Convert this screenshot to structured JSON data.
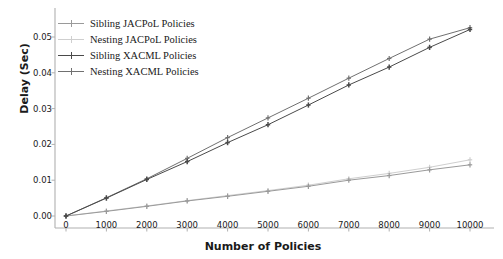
{
  "chart_data": {
    "type": "line",
    "title": "",
    "xlabel": "Number of Policies",
    "ylabel": "Delay (Sec)",
    "x": [
      0,
      1000,
      2000,
      3000,
      4000,
      5000,
      6000,
      7000,
      8000,
      9000,
      10000
    ],
    "xlim": [
      -500,
      10500
    ],
    "ylim": [
      -0.002,
      0.056
    ],
    "xticks": [
      0,
      1000,
      2000,
      3000,
      4000,
      5000,
      6000,
      7000,
      8000,
      9000,
      10000
    ],
    "xticklabels": [
      "0",
      "1000",
      "2000",
      "3000",
      "4000",
      "5000",
      "6000",
      "7000",
      "8000",
      "9000",
      "10000"
    ],
    "yticks": [
      0.0,
      0.01,
      0.02,
      0.03,
      0.04,
      0.05
    ],
    "yticklabels": [
      "0.00",
      "0.01",
      "0.02",
      "0.03",
      "0.04",
      "0.05"
    ],
    "grid": false,
    "legend_position": "upper left",
    "series": [
      {
        "name": "Sibling JACPoL Policies",
        "color": "#9a9a9a",
        "marker": "plus",
        "values": [
          0.0,
          0.0013,
          0.0027,
          0.0042,
          0.0055,
          0.0069,
          0.0083,
          0.01,
          0.0113,
          0.0129,
          0.0143
        ]
      },
      {
        "name": "Nesting JACPoL Policies",
        "color": "#cfcfcf",
        "marker": "plus",
        "values": [
          0.0,
          0.0014,
          0.0028,
          0.0043,
          0.0057,
          0.0071,
          0.0086,
          0.0104,
          0.0119,
          0.0136,
          0.0157
        ]
      },
      {
        "name": "Sibling XACML Policies",
        "color": "#4a4a4a",
        "marker": "plus",
        "values": [
          0.0,
          0.005,
          0.0102,
          0.0152,
          0.0205,
          0.0255,
          0.031,
          0.0366,
          0.0416,
          0.0471,
          0.0521
        ]
      },
      {
        "name": "Nesting XACML Policies",
        "color": "#707070",
        "marker": "plus",
        "values": [
          0.0,
          0.0051,
          0.0104,
          0.0161,
          0.0219,
          0.0274,
          0.0329,
          0.0385,
          0.044,
          0.0494,
          0.0526
        ]
      }
    ]
  },
  "axes": {
    "spine_color": "#b0b0b0"
  }
}
